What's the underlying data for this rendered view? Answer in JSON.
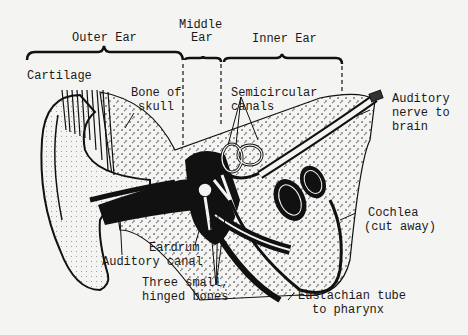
{
  "diagram": {
    "sections": {
      "outer": "Outer Ear",
      "middle_1": "Middle",
      "middle_2": "Ear",
      "inner": "Inner Ear"
    },
    "labels": {
      "cartilage": "Cartilage",
      "bone_1": "Bone of",
      "bone_2": "skull",
      "semi_1": "Semicircular",
      "semi_2": "canals",
      "nerve_1": "Auditory",
      "nerve_2": "nerve to",
      "nerve_3": "brain",
      "cochlea_1": "Cochlea",
      "cochlea_2": "(cut away)",
      "eardrum": "Eardrum",
      "canal": "Auditory canal",
      "bones_1": "Three small,",
      "bones_2": "hinged bones",
      "eust_1": "Eustachian tube",
      "eust_2": "to pharynx"
    },
    "colors": {
      "background": "#f4f4f2",
      "ink": "#1a1a1a"
    }
  }
}
